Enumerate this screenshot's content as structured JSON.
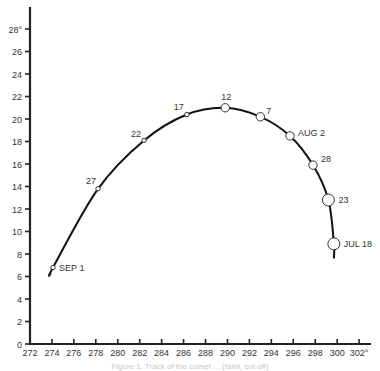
{
  "chart_data": {
    "type": "line",
    "title": "",
    "xlabel": "",
    "ylabel": "",
    "x_unit_suffix": "°",
    "y_unit_suffix": "°",
    "xlim": [
      272,
      303
    ],
    "ylim": [
      0,
      29
    ],
    "x_ticks": [
      272,
      274,
      276,
      278,
      280,
      282,
      284,
      286,
      288,
      290,
      292,
      294,
      296,
      298,
      300,
      302
    ],
    "x_tick_labels": [
      "272",
      "274",
      "276",
      "278",
      "280",
      "282",
      "284",
      "286",
      "288",
      "290",
      "292",
      "294",
      "296",
      "298",
      "300",
      "302°"
    ],
    "y_ticks": [
      0,
      2,
      4,
      6,
      8,
      10,
      12,
      14,
      16,
      18,
      20,
      22,
      24,
      26,
      28
    ],
    "y_tick_labels": [
      "0",
      "2",
      "4",
      "6",
      "8",
      "10",
      "12",
      "14",
      "16",
      "18",
      "20",
      "22",
      "24",
      "26",
      "28°"
    ],
    "grid": false,
    "legend": null,
    "series": [
      {
        "name": "track",
        "curve": [
          {
            "x": 299.7,
            "y": 7.6
          },
          {
            "x": 299.7,
            "y": 8.9
          },
          {
            "x": 299.2,
            "y": 12.8
          },
          {
            "x": 297.8,
            "y": 15.9
          },
          {
            "x": 295.7,
            "y": 18.5
          },
          {
            "x": 293.0,
            "y": 20.2
          },
          {
            "x": 289.8,
            "y": 21.0
          },
          {
            "x": 286.3,
            "y": 20.4
          },
          {
            "x": 282.4,
            "y": 18.1
          },
          {
            "x": 278.2,
            "y": 13.8
          },
          {
            "x": 274.1,
            "y": 6.8
          },
          {
            "x": 273.9,
            "y": 6.2
          }
        ],
        "points": [
          {
            "label": "JUL 18",
            "x": 299.7,
            "y": 8.9,
            "size": "large",
            "label_dx": 10,
            "label_dy": 3
          },
          {
            "label": "23",
            "x": 299.2,
            "y": 12.8,
            "size": "large",
            "label_dx": 10,
            "label_dy": 3
          },
          {
            "label": "28",
            "x": 297.8,
            "y": 15.9,
            "size": "medium",
            "label_dx": 8,
            "label_dy": -3
          },
          {
            "label": "AUG 2",
            "x": 295.7,
            "y": 18.5,
            "size": "medium",
            "label_dx": 8,
            "label_dy": 0
          },
          {
            "label": "7",
            "x": 293.0,
            "y": 20.2,
            "size": "medium",
            "label_dx": 6,
            "label_dy": -3
          },
          {
            "label": "12",
            "x": 289.8,
            "y": 21.0,
            "size": "medium",
            "label_dx": -4,
            "label_dy": -8
          },
          {
            "label": "17",
            "x": 286.3,
            "y": 20.4,
            "size": "small",
            "label_dx": -13,
            "label_dy": -5
          },
          {
            "label": "22",
            "x": 282.4,
            "y": 18.1,
            "size": "small",
            "label_dx": -13,
            "label_dy": -3
          },
          {
            "label": "27",
            "x": 278.2,
            "y": 13.8,
            "size": "small",
            "label_dx": -12,
            "label_dy": -5
          },
          {
            "label": "SEP 1",
            "x": 274.1,
            "y": 6.8,
            "size": "small",
            "label_dx": 6,
            "label_dy": 3
          }
        ]
      }
    ],
    "annotations": [
      "JUL 18",
      "23",
      "28",
      "AUG 2",
      "7",
      "12",
      "17",
      "22",
      "27",
      "SEP 1"
    ]
  },
  "caption": "Figure 1. Track of the comet ... (faint, cut off)",
  "colors": {
    "axis": "#222222",
    "curve": "#111111",
    "marker_fill": "#ffffff",
    "marker_stroke": "#333333",
    "text": "#333333"
  }
}
